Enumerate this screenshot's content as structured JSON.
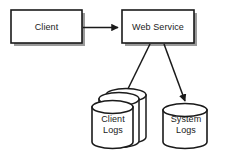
{
  "diagram": {
    "type": "architecture-flow-diagram",
    "background_color": "#ffffff",
    "stroke_color": "#1a1a1a",
    "shadow_color": "#9a9a9a",
    "fill_color": "#ffffff",
    "nodes": [
      {
        "id": "client",
        "shape": "rectangle",
        "label": "Client",
        "has_shadow": true
      },
      {
        "id": "web-service",
        "shape": "rectangle",
        "label": "Web Service",
        "has_shadow": true
      },
      {
        "id": "client-logs",
        "shape": "cylinder-stack",
        "label": "Client\nLogs",
        "stack_count": 3
      },
      {
        "id": "system-logs",
        "shape": "cylinder",
        "label": "System\nLogs",
        "stack_count": 1
      }
    ],
    "edges": [
      {
        "id": "client-to-web-service",
        "from": "client",
        "to": "web-service",
        "direction": "horizontal-right",
        "arrowhead": "filled-triangle"
      },
      {
        "id": "web-service-to-client-logs",
        "from": "web-service",
        "to": "client-logs",
        "direction": "diagonal-down-left",
        "arrowhead": "filled-triangle"
      },
      {
        "id": "web-service-to-system-logs",
        "from": "web-service",
        "to": "system-logs",
        "direction": "diagonal-down-right",
        "arrowhead": "filled-triangle"
      }
    ]
  }
}
